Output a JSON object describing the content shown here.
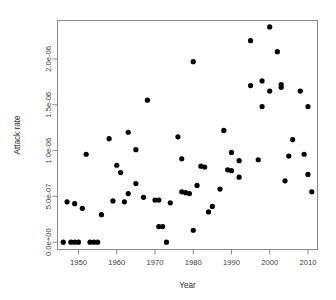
{
  "chart_data": {
    "type": "scatter",
    "title": "",
    "xlabel": "Year",
    "ylabel": "Attack rate",
    "xlim": [
      1944.5,
      2012.5
    ],
    "ylim": [
      -8e-08,
      2.42e-06
    ],
    "grid": false,
    "legend": null,
    "xticks": [
      "1950",
      "1960",
      "1970",
      "1980",
      "1990",
      "2000",
      "2010"
    ],
    "xtick_values": [
      1950,
      1960,
      1970,
      1980,
      1990,
      2000,
      2010
    ],
    "yticks": [
      "0.0e+00",
      "5.0e-07",
      "1.0e-06",
      "1.5e-06",
      "2.0e-06"
    ],
    "ytick_values": [
      0.0,
      5e-07,
      1e-06,
      1.5e-06,
      2e-06
    ],
    "marker": "filled-circle",
    "marker_color": "#000000",
    "marker_size": 2.6,
    "points": [
      {
        "x": 1946,
        "y": 0.0
      },
      {
        "x": 1947,
        "y": 4.4e-07
      },
      {
        "x": 1948,
        "y": 0.0
      },
      {
        "x": 1949,
        "y": 0.0
      },
      {
        "x": 1949,
        "y": 4.2e-07
      },
      {
        "x": 1950,
        "y": 0.0
      },
      {
        "x": 1951,
        "y": 3.7e-07
      },
      {
        "x": 1952,
        "y": 9.6e-07
      },
      {
        "x": 1953,
        "y": 0.0
      },
      {
        "x": 1954,
        "y": 0.0
      },
      {
        "x": 1955,
        "y": 0.0
      },
      {
        "x": 1956,
        "y": 3e-07
      },
      {
        "x": 1958,
        "y": 1.13e-06
      },
      {
        "x": 1959,
        "y": 4.5e-07
      },
      {
        "x": 1960,
        "y": 8.4e-07
      },
      {
        "x": 1961,
        "y": 7.6e-07
      },
      {
        "x": 1962,
        "y": 4.4e-07
      },
      {
        "x": 1963,
        "y": 5.3e-07
      },
      {
        "x": 1963,
        "y": 1.2e-06
      },
      {
        "x": 1965,
        "y": 1.01e-06
      },
      {
        "x": 1965,
        "y": 6.4e-07
      },
      {
        "x": 1967,
        "y": 4.9e-07
      },
      {
        "x": 1968,
        "y": 1.55e-06
      },
      {
        "x": 1970,
        "y": 4.6e-07
      },
      {
        "x": 1971,
        "y": 4.6e-07
      },
      {
        "x": 1971,
        "y": 1.7e-07
      },
      {
        "x": 1972,
        "y": 1.7e-07
      },
      {
        "x": 1973,
        "y": 0.0
      },
      {
        "x": 1974,
        "y": 4.3e-07
      },
      {
        "x": 1976,
        "y": 1.15e-06
      },
      {
        "x": 1977,
        "y": 5.5e-07
      },
      {
        "x": 1977,
        "y": 9.1e-07
      },
      {
        "x": 1978,
        "y": 5.4e-07
      },
      {
        "x": 1979,
        "y": 5.3e-07
      },
      {
        "x": 1980,
        "y": 1.3e-07
      },
      {
        "x": 1980,
        "y": 1.97e-06
      },
      {
        "x": 1981,
        "y": 6.2e-07
      },
      {
        "x": 1982,
        "y": 8.3e-07
      },
      {
        "x": 1983,
        "y": 8.2e-07
      },
      {
        "x": 1984,
        "y": 3.3e-07
      },
      {
        "x": 1985,
        "y": 3.9e-07
      },
      {
        "x": 1987,
        "y": 5.8e-07
      },
      {
        "x": 1988,
        "y": 1.22e-06
      },
      {
        "x": 1989,
        "y": 7.9e-07
      },
      {
        "x": 1990,
        "y": 7.8e-07
      },
      {
        "x": 1990,
        "y": 9.8e-07
      },
      {
        "x": 1992,
        "y": 8.9e-07
      },
      {
        "x": 1992,
        "y": 7.1e-07
      },
      {
        "x": 1995,
        "y": 1.71e-06
      },
      {
        "x": 1995,
        "y": 2.2e-06
      },
      {
        "x": 1997,
        "y": 9e-07
      },
      {
        "x": 1998,
        "y": 1.76e-06
      },
      {
        "x": 1998,
        "y": 1.48e-06
      },
      {
        "x": 2000,
        "y": 1.65e-06
      },
      {
        "x": 2000,
        "y": 2.35e-06
      },
      {
        "x": 2002,
        "y": 2.08e-06
      },
      {
        "x": 2003,
        "y": 1.72e-06
      },
      {
        "x": 2003,
        "y": 1.69e-06
      },
      {
        "x": 2004,
        "y": 6.7e-07
      },
      {
        "x": 2005,
        "y": 9.4e-07
      },
      {
        "x": 2006,
        "y": 1.12e-06
      },
      {
        "x": 2008,
        "y": 1.65e-06
      },
      {
        "x": 2009,
        "y": 9.6e-07
      },
      {
        "x": 2010,
        "y": 1.48e-06
      },
      {
        "x": 2010,
        "y": 7.4e-07
      },
      {
        "x": 2011,
        "y": 5.5e-07
      }
    ]
  }
}
